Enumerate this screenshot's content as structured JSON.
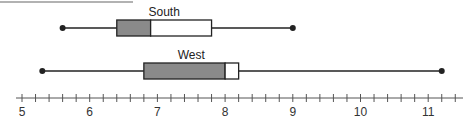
{
  "chart_data": {
    "type": "boxplot",
    "title": "",
    "xlabel": "",
    "ylabel": "",
    "xlim": [
      4.9,
      11.5
    ],
    "grid": false,
    "legend": null,
    "axis": {
      "major_ticks": [
        5,
        6,
        7,
        8,
        9,
        10,
        11
      ],
      "tick_labels": [
        "5",
        "6",
        "7",
        "8",
        "9",
        "10",
        "11"
      ],
      "minor_tick_step": 0.2
    },
    "series": [
      {
        "name": "South",
        "min": 5.6,
        "q1": 6.4,
        "median": 6.9,
        "q3": 7.8,
        "max": 9.0,
        "lower_box_color": "#8a8a8a",
        "upper_box_color": "#ffffff"
      },
      {
        "name": "West",
        "min": 5.3,
        "q1": 6.8,
        "median": 8.0,
        "q3": 8.2,
        "max": 11.2,
        "lower_box_color": "#8a8a8a",
        "upper_box_color": "#ffffff"
      }
    ]
  },
  "colors": {
    "stroke": "#222222",
    "shade": "#8a8a8a",
    "top_rule": "#999999"
  }
}
